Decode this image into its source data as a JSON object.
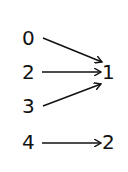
{
  "diagram": {
    "type": "mapping",
    "domain_nodes": [
      {
        "id": "d0",
        "label": "0",
        "x": 22,
        "y": 28
      },
      {
        "id": "d2",
        "label": "2",
        "x": 22,
        "y": 62
      },
      {
        "id": "d3",
        "label": "3",
        "x": 22,
        "y": 96
      },
      {
        "id": "d4",
        "label": "4",
        "x": 22,
        "y": 132
      }
    ],
    "codomain_nodes": [
      {
        "id": "c1",
        "label": "1",
        "x": 102,
        "y": 62
      },
      {
        "id": "c2",
        "label": "2",
        "x": 102,
        "y": 132
      }
    ],
    "edges": [
      {
        "from": "0",
        "to": "1"
      },
      {
        "from": "2",
        "to": "1"
      },
      {
        "from": "3",
        "to": "1"
      },
      {
        "from": "4",
        "to": "2"
      }
    ],
    "stroke_color": "#111111"
  }
}
